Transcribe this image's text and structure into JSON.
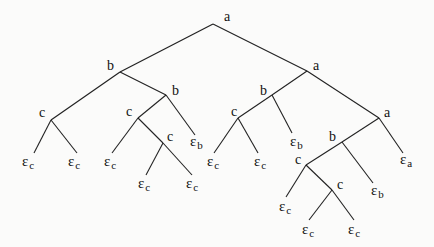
{
  "diagram": {
    "type": "tree",
    "stroke_color": "#222222",
    "nodes": [
      {
        "id": "n0",
        "label": "a",
        "x": 213,
        "y": 24,
        "lx": 224,
        "ly": 10
      },
      {
        "id": "n1",
        "label": "b",
        "x": 120,
        "y": 72,
        "lx": 107,
        "ly": 59
      },
      {
        "id": "n2",
        "label": "a",
        "x": 307,
        "y": 71,
        "lx": 313,
        "ly": 59
      },
      {
        "id": "n3",
        "label": "c",
        "x": 51,
        "y": 120,
        "lx": 39,
        "ly": 106
      },
      {
        "id": "n4",
        "label": "b",
        "x": 166,
        "y": 95,
        "lx": 172,
        "ly": 84
      },
      {
        "id": "n5",
        "label": "c",
        "x": 138,
        "y": 118,
        "lx": 126,
        "ly": 105
      },
      {
        "id": "n6",
        "label": "c",
        "x": 163,
        "y": 143,
        "lx": 167,
        "ly": 130
      },
      {
        "id": "n7",
        "label": "b",
        "x": 272,
        "y": 95,
        "lx": 260,
        "ly": 84
      },
      {
        "id": "n8",
        "label": "c",
        "x": 238,
        "y": 118,
        "lx": 231,
        "ly": 105
      },
      {
        "id": "n9",
        "label": "a",
        "x": 379,
        "y": 118,
        "lx": 384,
        "ly": 106
      },
      {
        "id": "n10",
        "label": "b",
        "x": 342,
        "y": 142,
        "lx": 329,
        "ly": 130
      },
      {
        "id": "n11",
        "label": "c",
        "x": 306,
        "y": 165,
        "lx": 295,
        "ly": 153
      },
      {
        "id": "n12",
        "label": "c",
        "x": 332,
        "y": 190,
        "lx": 337,
        "ly": 178
      }
    ],
    "leaves": [
      {
        "id": "l0",
        "symbol": "ε",
        "sub": "c",
        "x": 34,
        "y": 153,
        "lx": 22,
        "ly": 154
      },
      {
        "id": "l1",
        "symbol": "ε",
        "sub": "c",
        "x": 77,
        "y": 153,
        "lx": 68,
        "ly": 154
      },
      {
        "id": "l2",
        "symbol": "ε",
        "sub": "b",
        "x": 195,
        "y": 135,
        "lx": 190,
        "ly": 134
      },
      {
        "id": "l3",
        "symbol": "ε",
        "sub": "c",
        "x": 112,
        "y": 153,
        "lx": 104,
        "ly": 154
      },
      {
        "id": "l4",
        "symbol": "ε",
        "sub": "c",
        "x": 146,
        "y": 175,
        "lx": 138,
        "ly": 176
      },
      {
        "id": "l5",
        "symbol": "ε",
        "sub": "c",
        "x": 192,
        "y": 175,
        "lx": 186,
        "ly": 176
      },
      {
        "id": "l6",
        "symbol": "ε",
        "sub": "c",
        "x": 214,
        "y": 153,
        "lx": 207,
        "ly": 154
      },
      {
        "id": "l7",
        "symbol": "ε",
        "sub": "c",
        "x": 258,
        "y": 153,
        "lx": 254,
        "ly": 154
      },
      {
        "id": "l8",
        "symbol": "ε",
        "sub": "b",
        "x": 292,
        "y": 133,
        "lx": 290,
        "ly": 134
      },
      {
        "id": "l9",
        "symbol": "ε",
        "sub": "a",
        "x": 403,
        "y": 153,
        "lx": 400,
        "ly": 152
      },
      {
        "id": "l10",
        "symbol": "ε",
        "sub": "b",
        "x": 373,
        "y": 183,
        "lx": 371,
        "ly": 183
      },
      {
        "id": "l11",
        "symbol": "ε",
        "sub": "c",
        "x": 286,
        "y": 197,
        "lx": 279,
        "ly": 199
      },
      {
        "id": "l12",
        "symbol": "ε",
        "sub": "c",
        "x": 309,
        "y": 220,
        "lx": 302,
        "ly": 222
      },
      {
        "id": "l13",
        "symbol": "ε",
        "sub": "c",
        "x": 354,
        "y": 220,
        "lx": 348,
        "ly": 222
      }
    ],
    "edges": [
      [
        "n0",
        "n1"
      ],
      [
        "n0",
        "n2"
      ],
      [
        "n1",
        "n3"
      ],
      [
        "n1",
        "n4"
      ],
      [
        "n3",
        "l0"
      ],
      [
        "n3",
        "l1"
      ],
      [
        "n4",
        "n5"
      ],
      [
        "n4",
        "l2"
      ],
      [
        "n5",
        "l3"
      ],
      [
        "n5",
        "n6"
      ],
      [
        "n6",
        "l4"
      ],
      [
        "n6",
        "l5"
      ],
      [
        "n2",
        "n7"
      ],
      [
        "n2",
        "n9"
      ],
      [
        "n7",
        "n8"
      ],
      [
        "n7",
        "l8"
      ],
      [
        "n8",
        "l6"
      ],
      [
        "n8",
        "l7"
      ],
      [
        "n9",
        "n10"
      ],
      [
        "n9",
        "l9"
      ],
      [
        "n10",
        "n11"
      ],
      [
        "n10",
        "l10"
      ],
      [
        "n11",
        "l11"
      ],
      [
        "n11",
        "n12"
      ],
      [
        "n12",
        "l12"
      ],
      [
        "n12",
        "l13"
      ]
    ]
  }
}
